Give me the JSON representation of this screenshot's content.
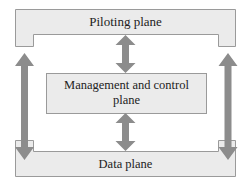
{
  "diagram": {
    "nodes": [
      {
        "id": "piloting",
        "label": "Piloting plane"
      },
      {
        "id": "management",
        "label": "Management and control plane",
        "lines": [
          "Management and control",
          "plane"
        ]
      },
      {
        "id": "data",
        "label": "Data plane"
      }
    ],
    "edges": [
      {
        "from": "piloting",
        "to": "management",
        "type": "bidirectional"
      },
      {
        "from": "management",
        "to": "data",
        "type": "bidirectional"
      },
      {
        "from": "piloting",
        "to": "data",
        "type": "bidirectional",
        "side": "left"
      },
      {
        "from": "piloting",
        "to": "data",
        "type": "bidirectional",
        "side": "right"
      }
    ],
    "colors": {
      "box_fill": "#ebebeb",
      "box_stroke": "#9a9a9a",
      "arrow": "#8c8c8c",
      "text": "#222222"
    }
  }
}
